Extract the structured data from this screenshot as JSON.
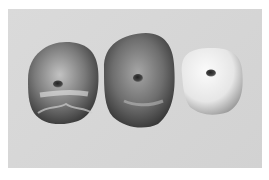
{
  "image": {
    "description": "Three rounded stone beads on a gray background",
    "background_color": "#d6d6d6",
    "border_color": "#ffffff"
  },
  "beads": [
    {
      "name": "left-bead",
      "tone": "dark gray",
      "color_light": "#bdbdbd",
      "color_dark": "#3c3c3c"
    },
    {
      "name": "middle-bead",
      "tone": "medium-dark gray",
      "color_light": "#a8a8a8",
      "color_dark": "#3a3a3a"
    },
    {
      "name": "right-bead",
      "tone": "white",
      "color_light": "#f4f4f4",
      "color_dark": "#9a9a9a"
    }
  ]
}
